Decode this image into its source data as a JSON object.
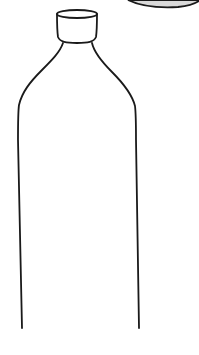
{
  "image": {
    "subject": "line drawing of a bottle",
    "colors": {
      "background": "#ffffff",
      "line": "#1a1a1a",
      "corner_shape_fill": "#d9d9d9"
    }
  }
}
